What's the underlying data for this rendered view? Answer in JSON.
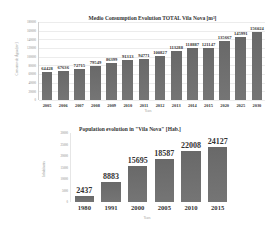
{
  "chart_data": [
    {
      "type": "bar",
      "title": "Medio Consumption Evolution TOTAL Vila Nova [m³]",
      "xlabel": "Years",
      "ylabel": "Consumo de Água [m³]",
      "categories": [
        "2005",
        "2006",
        "2007",
        "2008",
        "2009",
        "2010",
        "2011",
        "2012",
        "2013",
        "2014",
        "2015",
        "2020",
        "2025",
        "2030"
      ],
      "values": [
        64428,
        67636,
        72715,
        79549,
        86399,
        91313,
        94771,
        100827,
        113288,
        118887,
        121147,
        135667,
        145991,
        156024
      ],
      "value_labels": [
        "64428",
        "67636",
        "72715",
        "79549",
        "86399",
        "91313",
        "94771",
        "100827",
        "113288",
        "118887",
        "121147",
        "135667",
        "145991",
        "156024"
      ],
      "ylim": [
        0,
        180000
      ],
      "yticks": [
        "0",
        "20000",
        "40000",
        "60000",
        "80000",
        "100000",
        "120000",
        "140000",
        "160000",
        "180000"
      ],
      "grid": true,
      "legend": "none",
      "bar_color": "#757575"
    },
    {
      "type": "bar",
      "title": "Population evolution in \"Vila Nova\" [Hab.]",
      "xlabel": "Years",
      "ylabel": "Inhabitants",
      "categories": [
        "1980",
        "1991",
        "2000",
        "2005",
        "2010",
        "2015"
      ],
      "values": [
        2437,
        8883,
        15695,
        18587,
        22008,
        24127
      ],
      "value_labels": [
        "2437",
        "8883",
        "15695",
        "18587",
        "22008",
        "24127"
      ],
      "ylim": [
        0,
        30000
      ],
      "yticks": [
        "0",
        "5000",
        "10000",
        "15000",
        "20000",
        "25000",
        "30000"
      ],
      "grid": false,
      "legend": "none",
      "bar_color": "#757575"
    }
  ]
}
